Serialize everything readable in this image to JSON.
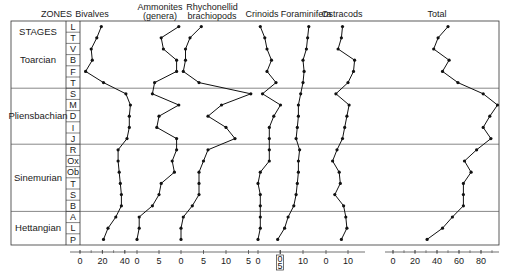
{
  "header": {
    "zones_label": "ZONES",
    "stages_label": "STAGES"
  },
  "stages": [
    {
      "name": "Toarcian",
      "zones": [
        "L",
        "T",
        "V",
        "B",
        "F",
        "T"
      ]
    },
    {
      "name": "Pliensbachian",
      "zones": [
        "S",
        "M",
        "D",
        "I",
        "J"
      ]
    },
    {
      "name": "Sinemurian",
      "zones": [
        "R",
        "Ox",
        "Ob",
        "T",
        "S",
        "B"
      ]
    },
    {
      "name": "Hettangian",
      "zones": [
        "A",
        "L",
        "P"
      ]
    }
  ],
  "chart_data": {
    "type": "line",
    "title": "",
    "orientation": "vertical-stratigraphic",
    "categories": [
      "L",
      "T",
      "V",
      "B",
      "F",
      "T",
      "S",
      "M",
      "D",
      "I",
      "J",
      "R",
      "Ox",
      "Ob",
      "T",
      "S",
      "B",
      "A",
      "L",
      "P"
    ],
    "category_stages": [
      "Toarcian",
      "Toarcian",
      "Toarcian",
      "Toarcian",
      "Toarcian",
      "Toarcian",
      "Pliensbachian",
      "Pliensbachian",
      "Pliensbachian",
      "Pliensbachian",
      "Pliensbachian",
      "Sinemurian",
      "Sinemurian",
      "Sinemurian",
      "Sinemurian",
      "Sinemurian",
      "Sinemurian",
      "Hettangian",
      "Hettangian",
      "Hettangian"
    ],
    "series": [
      {
        "name": "Bivalves",
        "label_lines": [
          "Bivalves"
        ],
        "ticks": [
          "0",
          "20",
          "40"
        ],
        "tick_values": [
          0,
          20,
          40
        ],
        "xlim": [
          0,
          46
        ],
        "values": [
          19,
          15,
          10,
          11,
          5,
          21,
          41,
          45,
          44,
          44,
          42,
          34,
          34,
          35,
          36,
          37,
          37,
          32,
          25,
          21
        ]
      },
      {
        "name": "Ammonites (genera)",
        "label_lines": [
          "Ammonites",
          "(genera)"
        ],
        "ticks": [
          "0",
          "5"
        ],
        "tick_values": [
          0,
          5
        ],
        "xlim": [
          0,
          10
        ],
        "values": [
          9.5,
          5.5,
          6,
          9,
          9,
          4,
          3.5,
          9.5,
          5,
          4.5,
          9,
          9,
          8,
          8.5,
          5.5,
          5,
          3.5,
          0.5,
          0.5,
          0
        ]
      },
      {
        "name": "Rhynchonellid brachiopods",
        "label_lines": [
          "Rhychonellid",
          "brachiopods"
        ],
        "ticks": [
          "0",
          "5",
          "10",
          "5"
        ],
        "tick_values": [
          0,
          5,
          10,
          15
        ],
        "xlim": [
          0,
          17
        ],
        "values": [
          4.5,
          2,
          1,
          1,
          0.5,
          4,
          15.5,
          9,
          6,
          10,
          12,
          6,
          5,
          4,
          4,
          4,
          2.5,
          0.5,
          0,
          0
        ]
      },
      {
        "name": "Crinoids",
        "label_lines": [
          "Crinoids"
        ],
        "ticks": [
          "0",
          "5"
        ],
        "tick_values": [
          0,
          5
        ],
        "xlim": [
          0,
          5
        ],
        "values": [
          0.5,
          1.5,
          2,
          3,
          2,
          4,
          1,
          5,
          3.5,
          2.5,
          2.5,
          2.5,
          2.5,
          0.5,
          0,
          0.5,
          0.5,
          0.5,
          0.5,
          0
        ]
      },
      {
        "name": "Foraminifera",
        "label_lines": [
          "Foraminifera"
        ],
        "ticks": [
          "0",
          "10"
        ],
        "tick_values": [
          0,
          10
        ],
        "xlim": [
          0,
          12
        ],
        "values": [
          12.5,
          12,
          11.5,
          10,
          10.5,
          10,
          9,
          8,
          8,
          7.5,
          7,
          8.5,
          8,
          8,
          7.5,
          7,
          6,
          3.5,
          2,
          -1
        ]
      },
      {
        "name": "Ostracods",
        "label_lines": [
          "Ostracods"
        ],
        "ticks": [
          "0",
          "10"
        ],
        "tick_values": [
          0,
          10
        ],
        "xlim": [
          0,
          14
        ],
        "values": [
          7.5,
          7,
          5.5,
          13,
          12.5,
          10,
          4.5,
          10.5,
          9.5,
          8.5,
          7.5,
          5,
          3,
          6,
          6.5,
          4,
          8,
          9,
          9.5,
          7
        ]
      },
      {
        "name": "Total",
        "label_lines": [
          "Total"
        ],
        "ticks": [
          "0",
          "20",
          "40",
          "60",
          "80"
        ],
        "tick_values": [
          0,
          20,
          40,
          60,
          80
        ],
        "xlim": [
          0,
          95
        ],
        "values": [
          50,
          41,
          37,
          51,
          45,
          59,
          82,
          95,
          88,
          82,
          89,
          76,
          65,
          71,
          64,
          64,
          64,
          54,
          45,
          31
        ]
      }
    ],
    "xlabel": "",
    "ylabel": "",
    "grid": false,
    "legend": "none"
  }
}
